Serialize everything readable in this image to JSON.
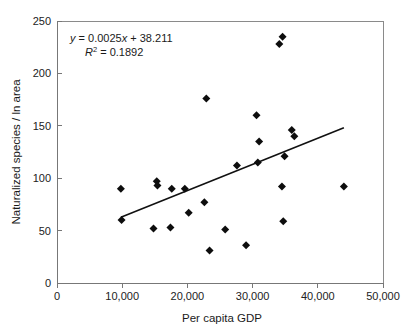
{
  "chart_data": {
    "type": "scatter",
    "title": "",
    "xlabel": "Per capita GDP",
    "ylabel": "Naturalized species / ln area",
    "xlim": [
      0,
      50000
    ],
    "ylim": [
      0,
      250
    ],
    "xticks": [
      0,
      10000,
      20000,
      30000,
      40000,
      50000
    ],
    "xticklabels": [
      "0",
      "10,000",
      "20,000",
      "30,000",
      "40,000",
      "50,000"
    ],
    "yticks": [
      0,
      50,
      100,
      150,
      200,
      250
    ],
    "yticklabels": [
      "0",
      "50",
      "100",
      "150",
      "200",
      "250"
    ],
    "grid": false,
    "legend": null,
    "marker": "diamond",
    "marker_color": "#0d0d0d",
    "points": [
      {
        "x": 9800,
        "y": 90
      },
      {
        "x": 9900,
        "y": 60
      },
      {
        "x": 14800,
        "y": 52
      },
      {
        "x": 15300,
        "y": 97
      },
      {
        "x": 15400,
        "y": 93
      },
      {
        "x": 17400,
        "y": 53
      },
      {
        "x": 17600,
        "y": 90
      },
      {
        "x": 19600,
        "y": 90
      },
      {
        "x": 20200,
        "y": 67
      },
      {
        "x": 22600,
        "y": 77
      },
      {
        "x": 22900,
        "y": 176
      },
      {
        "x": 23400,
        "y": 31
      },
      {
        "x": 25800,
        "y": 51
      },
      {
        "x": 27600,
        "y": 112
      },
      {
        "x": 29000,
        "y": 36
      },
      {
        "x": 30600,
        "y": 160
      },
      {
        "x": 30800,
        "y": 115
      },
      {
        "x": 31000,
        "y": 135
      },
      {
        "x": 34100,
        "y": 228
      },
      {
        "x": 34500,
        "y": 92
      },
      {
        "x": 34600,
        "y": 235
      },
      {
        "x": 34700,
        "y": 59
      },
      {
        "x": 34900,
        "y": 121
      },
      {
        "x": 36000,
        "y": 146
      },
      {
        "x": 36400,
        "y": 140
      },
      {
        "x": 44000,
        "y": 92
      }
    ],
    "trendline": {
      "slope": 0.0025,
      "intercept": 38.211,
      "x_start": 9800,
      "x_end": 44000,
      "equation": "y = 0.0025x + 38.211",
      "r_squared_label": "R",
      "r_squared_exponent": "2",
      "r_squared_value": "= 0.1892",
      "r_squared": 0.1892
    },
    "annotations": [
      {
        "name": "regression-equation",
        "text": "y = 0.0025x + 38.211"
      },
      {
        "name": "r-squared",
        "text": "R2 = 0.1892"
      }
    ]
  },
  "axis": {
    "x_title": "Per capita GDP",
    "y_title": "Naturalized species / ln area"
  },
  "equation": {
    "y_var": "y",
    "body": " = 0.0025",
    "x_var": "x",
    "tail": " + 38.211",
    "r_var": "R",
    "r_sup": "2",
    "r_tail": " = 0.1892"
  }
}
